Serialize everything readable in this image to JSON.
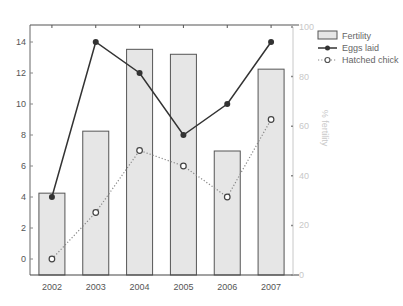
{
  "chart_data": {
    "type": "bar+line",
    "title": "",
    "xlabel": "",
    "ylabel": "",
    "y2label": "% fertility",
    "categories": [
      "2002",
      "2003",
      "2004",
      "2005",
      "2006",
      "2007"
    ],
    "series": [
      {
        "name": "Fertility",
        "type": "bar",
        "axis": "right",
        "values": [
          33,
          58,
          91,
          89,
          50,
          83
        ]
      },
      {
        "name": "Eggs laid",
        "type": "line",
        "style": "solid",
        "marker": "filled-circle",
        "axis": "left",
        "values": [
          4,
          14,
          12,
          8,
          10,
          14
        ]
      },
      {
        "name": "Hatched chick",
        "type": "line",
        "style": "dotted",
        "marker": "open-circle",
        "axis": "left",
        "values": [
          0,
          3,
          7,
          6,
          4,
          9
        ]
      }
    ],
    "ylim": [
      -1,
      15
    ],
    "y2lim": [
      0,
      100
    ],
    "yticks": [
      0,
      2,
      4,
      6,
      8,
      10,
      12,
      14
    ],
    "y2ticks": [
      0,
      20,
      40,
      60,
      80,
      100
    ],
    "grid": false,
    "legend_position": "top-right-outside",
    "colors": {
      "bar_fill": "#e6e6e6",
      "bar_stroke": "#555555",
      "eggs_line": "#333333",
      "hatched_line": "#888888",
      "right_axis": "#c8c8c8"
    }
  },
  "legend": {
    "items": [
      {
        "label": "Fertility"
      },
      {
        "label": "Eggs laid"
      },
      {
        "label": "Hatched chick"
      }
    ]
  }
}
